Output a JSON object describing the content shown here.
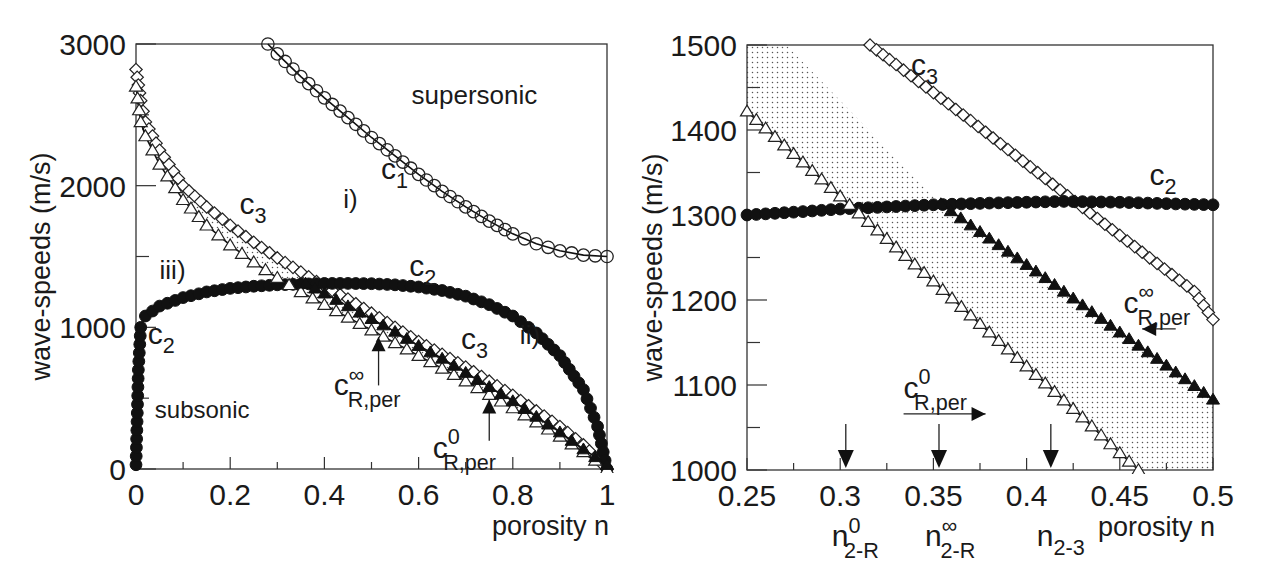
{
  "figure": {
    "panels": [
      "left",
      "right"
    ]
  },
  "chart_data": [
    {
      "id": "left",
      "type": "scatter",
      "title": "",
      "xlabel": "porosity n",
      "ylabel": "wave-speeds (m/s)",
      "xlim": [
        0,
        1
      ],
      "ylim": [
        0,
        3000
      ],
      "grid": false,
      "frame": {
        "left": 136,
        "right": 607,
        "top": 44,
        "bottom": 469
      },
      "xticks": [
        0,
        0.2,
        0.4,
        0.6,
        0.8,
        1
      ],
      "xtick_labels": [
        "0",
        "0.2",
        "0.4",
        "0.6",
        "0.8",
        "1"
      ],
      "xminor": [
        0.1,
        0.3,
        0.5,
        0.7,
        0.9
      ],
      "yticks": [
        0,
        1000,
        2000,
        3000
      ],
      "ytick_labels": [
        "0",
        "1000",
        "2000",
        "3000"
      ],
      "yminor": [
        500,
        1500,
        2500
      ],
      "shaded_region": {
        "description": "dotted region between c_R,per^0 and c3 / c_R,per^inf",
        "upper": [
          [
            0,
            2800
          ],
          [
            0.02,
            2450
          ],
          [
            0.05,
            2250
          ],
          [
            0.1,
            2000
          ],
          [
            0.15,
            1850
          ],
          [
            0.2,
            1720
          ],
          [
            0.25,
            1600
          ],
          [
            0.3,
            1490
          ],
          [
            0.35,
            1390
          ],
          [
            0.4,
            1290
          ],
          [
            0.5,
            1100
          ],
          [
            0.6,
            900
          ],
          [
            0.7,
            720
          ],
          [
            0.8,
            520
          ],
          [
            0.9,
            300
          ],
          [
            0.95,
            170
          ],
          [
            1.0,
            0
          ]
        ],
        "lower": [
          [
            1.0,
            0
          ],
          [
            0.95,
            120
          ],
          [
            0.9,
            230
          ],
          [
            0.8,
            430
          ],
          [
            0.7,
            620
          ],
          [
            0.6,
            800
          ],
          [
            0.5,
            980
          ],
          [
            0.4,
            1160
          ],
          [
            0.35,
            1250
          ],
          [
            0.3,
            1350
          ],
          [
            0.25,
            1460
          ],
          [
            0.2,
            1580
          ],
          [
            0.15,
            1720
          ],
          [
            0.1,
            1900
          ],
          [
            0.05,
            2150
          ],
          [
            0.02,
            2350
          ],
          [
            0,
            2700
          ]
        ]
      },
      "series": [
        {
          "name": "c1",
          "marker": "open-circle",
          "label": "c",
          "label_sub": "1",
          "points": [
            [
              0.28,
              3000
            ],
            [
              0.3,
              2930
            ],
            [
              0.35,
              2770
            ],
            [
              0.4,
              2620
            ],
            [
              0.45,
              2480
            ],
            [
              0.5,
              2340
            ],
            [
              0.55,
              2210
            ],
            [
              0.6,
              2080
            ],
            [
              0.65,
              1960
            ],
            [
              0.7,
              1850
            ],
            [
              0.75,
              1750
            ],
            [
              0.8,
              1660
            ],
            [
              0.85,
              1590
            ],
            [
              0.9,
              1540
            ],
            [
              0.95,
              1510
            ],
            [
              1.0,
              1500
            ]
          ]
        },
        {
          "name": "c3",
          "marker": "open-diamond",
          "label": "c",
          "label_sub": "3",
          "points": [
            [
              0,
              2820
            ],
            [
              0.01,
              2600
            ],
            [
              0.02,
              2450
            ],
            [
              0.05,
              2250
            ],
            [
              0.1,
              2000
            ],
            [
              0.15,
              1850
            ],
            [
              0.2,
              1720
            ],
            [
              0.25,
              1600
            ],
            [
              0.3,
              1490
            ],
            [
              0.35,
              1390
            ],
            [
              0.4,
              1290
            ],
            [
              0.45,
              1200
            ],
            [
              0.5,
              1100
            ],
            [
              0.55,
              1000
            ],
            [
              0.6,
              900
            ],
            [
              0.65,
              810
            ],
            [
              0.7,
              720
            ],
            [
              0.75,
              620
            ],
            [
              0.8,
              520
            ],
            [
              0.85,
              410
            ],
            [
              0.9,
              300
            ],
            [
              0.95,
              170
            ],
            [
              1.0,
              0
            ]
          ]
        },
        {
          "name": "c2",
          "marker": "filled-circle",
          "label": "c",
          "label_sub": "2",
          "points": [
            [
              0,
              30
            ],
            [
              0.005,
              700
            ],
            [
              0.01,
              1000
            ],
            [
              0.02,
              1080
            ],
            [
              0.05,
              1150
            ],
            [
              0.1,
              1210
            ],
            [
              0.15,
              1250
            ],
            [
              0.2,
              1275
            ],
            [
              0.25,
              1290
            ],
            [
              0.3,
              1300
            ],
            [
              0.35,
              1305
            ],
            [
              0.4,
              1310
            ],
            [
              0.45,
              1310
            ],
            [
              0.5,
              1308
            ],
            [
              0.55,
              1300
            ],
            [
              0.6,
              1285
            ],
            [
              0.65,
              1260
            ],
            [
              0.7,
              1220
            ],
            [
              0.75,
              1160
            ],
            [
              0.8,
              1080
            ],
            [
              0.85,
              960
            ],
            [
              0.9,
              800
            ],
            [
              0.95,
              560
            ],
            [
              0.98,
              300
            ],
            [
              1.0,
              0
            ]
          ]
        },
        {
          "name": "c_R,per^0",
          "marker": "open-triangle",
          "label": "c",
          "label_sub": "R,per",
          "label_sup": "0",
          "points": [
            [
              0,
              2700
            ],
            [
              0.01,
              2450
            ],
            [
              0.02,
              2350
            ],
            [
              0.05,
              2150
            ],
            [
              0.1,
              1900
            ],
            [
              0.15,
              1720
            ],
            [
              0.2,
              1580
            ],
            [
              0.25,
              1460
            ],
            [
              0.3,
              1350
            ],
            [
              0.35,
              1250
            ],
            [
              0.4,
              1160
            ],
            [
              0.45,
              1070
            ],
            [
              0.5,
              980
            ],
            [
              0.55,
              890
            ],
            [
              0.6,
              800
            ],
            [
              0.65,
              710
            ],
            [
              0.7,
              620
            ],
            [
              0.75,
              525
            ],
            [
              0.8,
              430
            ],
            [
              0.85,
              330
            ],
            [
              0.9,
              230
            ],
            [
              0.95,
              120
            ],
            [
              1.0,
              0
            ]
          ]
        },
        {
          "name": "c_R,per^inf",
          "marker": "filled-triangle",
          "label": "c",
          "label_sub": "R,per",
          "label_sup": "∞",
          "points": [
            [
              0.36,
              1310
            ],
            [
              0.4,
              1240
            ],
            [
              0.45,
              1150
            ],
            [
              0.5,
              1060
            ],
            [
              0.55,
              970
            ],
            [
              0.6,
              870
            ],
            [
              0.65,
              780
            ],
            [
              0.7,
              680
            ],
            [
              0.75,
              580
            ],
            [
              0.8,
              480
            ],
            [
              0.85,
              370
            ],
            [
              0.9,
              260
            ],
            [
              0.95,
              140
            ],
            [
              1.0,
              30
            ]
          ]
        }
      ],
      "annotations": [
        {
          "text": "supersonic",
          "x": 0.585,
          "y": 2580,
          "size": 26
        },
        {
          "text": "subsonic",
          "x": 0.04,
          "y": 360,
          "size": 24
        },
        {
          "text": "i)",
          "x": 0.44,
          "y": 1840,
          "size": 26
        },
        {
          "text": "ii)",
          "x": 0.815,
          "y": 880,
          "size": 26
        },
        {
          "text": "iii)",
          "x": 0.05,
          "y": 1340,
          "size": 26
        }
      ],
      "curve_labels": [
        {
          "series": "c1",
          "x": 0.52,
          "y": 2050
        },
        {
          "series": "c3",
          "x": 0.22,
          "y": 1800
        },
        {
          "series": "c2",
          "x": 0.58,
          "y": 1360
        },
        {
          "series": "c2",
          "x": 0.025,
          "y": 880
        },
        {
          "series": "c3",
          "x": 0.69,
          "y": 850
        }
      ],
      "arrow_labels": [
        {
          "series": "c_R,per^inf",
          "label_x": 0.42,
          "label_y": 520,
          "arrow_from": [
            0.515,
            590
          ],
          "arrow_to": [
            0.515,
            930
          ]
        },
        {
          "series": "c_R,per^0",
          "label_x": 0.63,
          "label_y": 80,
          "arrow_from": [
            0.75,
            200
          ],
          "arrow_to": [
            0.75,
            490
          ]
        }
      ]
    },
    {
      "id": "right",
      "type": "scatter",
      "title": "",
      "xlabel": "porosity n",
      "ylabel": "wave-speeds (m/s)",
      "xlim": [
        0.25,
        0.5
      ],
      "ylim": [
        1000,
        1500
      ],
      "grid": false,
      "frame": {
        "left": 747,
        "right": 1213,
        "top": 45,
        "bottom": 470
      },
      "xticks": [
        0.25,
        0.3,
        0.35,
        0.4,
        0.45,
        0.5
      ],
      "xtick_labels": [
        "0.25",
        "0.3",
        "0.35",
        "0.4",
        "0.45",
        "0.5"
      ],
      "xminor": [
        0.275,
        0.325,
        0.375,
        0.425,
        0.475
      ],
      "yticks": [
        1000,
        1100,
        1200,
        1300,
        1400,
        1500
      ],
      "ytick_labels": [
        "1000",
        "1100",
        "1200",
        "1300",
        "1400",
        "1500"
      ],
      "yminor": [
        1050,
        1150,
        1250,
        1350,
        1450
      ],
      "shaded_region": {
        "description": "dotted region between c_R,per^0 and upper bound",
        "polygon": [
          [
            0.25,
            1500
          ],
          [
            0.271,
            1500
          ],
          [
            0.354,
            1313
          ],
          [
            0.5,
            1083
          ],
          [
            0.5,
            1000
          ],
          [
            0.46,
            1000
          ],
          [
            0.25,
            1422
          ]
        ]
      },
      "series": [
        {
          "name": "c3",
          "marker": "open-diamond",
          "label": "c",
          "label_sub": "3",
          "points": [
            [
              0.316,
              1500
            ],
            [
              0.33,
              1477
            ],
            [
              0.35,
              1444
            ],
            [
              0.37,
              1411
            ],
            [
              0.39,
              1377
            ],
            [
              0.41,
              1343
            ],
            [
              0.43,
              1309
            ],
            [
              0.45,
              1276
            ],
            [
              0.47,
              1243
            ],
            [
              0.49,
              1210
            ],
            [
              0.5,
              1177
            ]
          ]
        },
        {
          "name": "c2",
          "marker": "filled-circle",
          "label": "c",
          "label_sub": "2",
          "points": [
            [
              0.25,
              1300
            ],
            [
              0.28,
              1304
            ],
            [
              0.3,
              1307
            ],
            [
              0.33,
              1310
            ],
            [
              0.35,
              1312
            ],
            [
              0.38,
              1314
            ],
            [
              0.4,
              1315
            ],
            [
              0.42,
              1316
            ],
            [
              0.45,
              1315
            ],
            [
              0.48,
              1313
            ],
            [
              0.5,
              1312
            ]
          ]
        },
        {
          "name": "c_R,per^0",
          "marker": "open-triangle",
          "label": "c",
          "label_sub": "R,per",
          "label_sup": "0",
          "points": [
            [
              0.25,
              1422
            ],
            [
              0.27,
              1382
            ],
            [
              0.29,
              1342
            ],
            [
              0.31,
              1302
            ],
            [
              0.33,
              1262
            ],
            [
              0.35,
              1222
            ],
            [
              0.37,
              1182
            ],
            [
              0.39,
              1142
            ],
            [
              0.41,
              1102
            ],
            [
              0.43,
              1062
            ],
            [
              0.45,
              1020
            ],
            [
              0.46,
              1000
            ]
          ]
        },
        {
          "name": "c_R,per^inf",
          "marker": "filled-triangle",
          "label": "c",
          "label_sub": "R,per",
          "label_sup": "∞",
          "points": [
            [
              0.354,
              1313
            ],
            [
              0.37,
              1288
            ],
            [
              0.39,
              1257
            ],
            [
              0.41,
              1226
            ],
            [
              0.43,
              1194
            ],
            [
              0.45,
              1162
            ],
            [
              0.47,
              1131
            ],
            [
              0.49,
              1099
            ],
            [
              0.5,
              1083
            ]
          ]
        }
      ],
      "curve_labels": [
        {
          "series": "c3",
          "x": 0.338,
          "y": 1465
        },
        {
          "series": "c2",
          "x": 0.466,
          "y": 1335
        }
      ],
      "arrow_labels": [
        {
          "series": "c_R,per^0",
          "label_x": 0.334,
          "label_y": 1085,
          "arrow_from": [
            0.334,
            1066
          ],
          "arrow_to": [
            0.378,
            1066
          ],
          "direction": "right"
        },
        {
          "series": "c_R,per^inf",
          "label_x": 0.452,
          "label_y": 1185,
          "arrow_from": [
            0.48,
            1166
          ],
          "arrow_to": [
            0.462,
            1166
          ],
          "direction": "left"
        }
      ],
      "markers_below": [
        {
          "x": 0.303,
          "label": "n",
          "sub": "2-R",
          "sup": "0"
        },
        {
          "x": 0.353,
          "label": "n",
          "sub": "2-R",
          "sup": "∞"
        },
        {
          "x": 0.413,
          "label": "n",
          "sub": "2-3",
          "sup": ""
        }
      ]
    }
  ]
}
